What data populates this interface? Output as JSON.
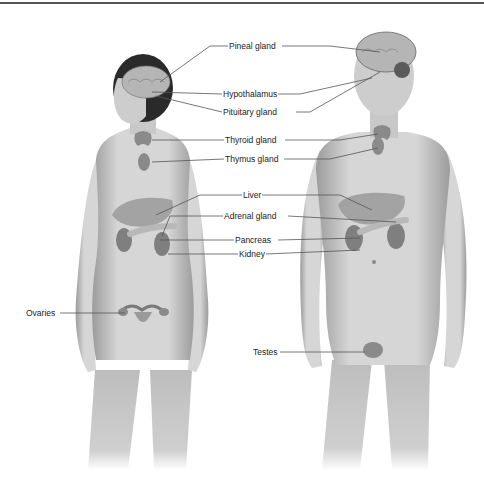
{
  "diagram": {
    "colors": {
      "skin": "#d4d4d4",
      "skin_shade": "#9a9a9a",
      "organ": "#8a8a8a",
      "hair": "#2a2a2a",
      "line": "#555555",
      "text": "#222222"
    },
    "labels": [
      {
        "id": "pineal",
        "text": "Pineal gland",
        "x": 228,
        "y": 42
      },
      {
        "id": "hypothalamus",
        "text": "Hypothalamus",
        "x": 222,
        "y": 90
      },
      {
        "id": "pituitary",
        "text": "Pituitary gland",
        "x": 222,
        "y": 108
      },
      {
        "id": "thyroid",
        "text": "Thyroid gland",
        "x": 224,
        "y": 136
      },
      {
        "id": "thymus",
        "text": "Thymus gland",
        "x": 224,
        "y": 155
      },
      {
        "id": "liver",
        "text": "Liver",
        "x": 242,
        "y": 191
      },
      {
        "id": "adrenal",
        "text": "Adrenal gland",
        "x": 223,
        "y": 212
      },
      {
        "id": "pancreas",
        "text": "Pancreas",
        "x": 234,
        "y": 236
      },
      {
        "id": "kidney",
        "text": "Kidney",
        "x": 238,
        "y": 250
      },
      {
        "id": "ovaries",
        "text": "Ovaries",
        "x": 25,
        "y": 309
      },
      {
        "id": "testes",
        "text": "Testes",
        "x": 252,
        "y": 348
      }
    ],
    "figures": [
      {
        "id": "female",
        "label": "Female figure"
      },
      {
        "id": "male",
        "label": "Male figure"
      }
    ]
  }
}
